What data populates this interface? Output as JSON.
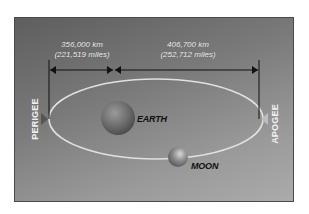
{
  "diagram": {
    "distances": {
      "perigee": {
        "km": "356,000 km",
        "miles": "(221,519 miles)"
      },
      "apogee": {
        "km": "406,700 km",
        "miles": "(252,712 miles)"
      }
    },
    "labels": {
      "earth": "EARTH",
      "moon": "MOON",
      "perigee": "PERIGEE",
      "apogee": "APOGEE"
    },
    "colors": {
      "panel_dark": "#5e5e5e",
      "panel_light": "#ababab",
      "orbit": "#e0e0e0",
      "arrows": "#111111",
      "label_light": "#f0f0f0",
      "label_dark": "#111111"
    }
  }
}
